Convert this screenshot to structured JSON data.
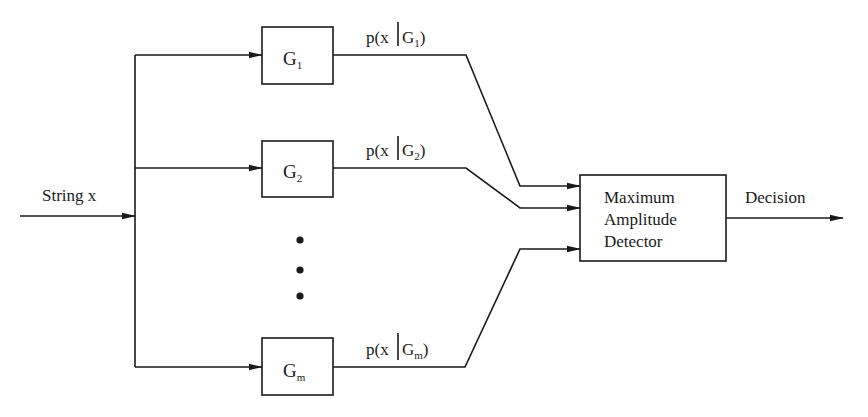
{
  "diagram": {
    "type": "block-diagram",
    "colors": {
      "line": "#1a1a1a",
      "background": "#ffffff"
    },
    "input": {
      "label": "String x"
    },
    "classifiers": [
      {
        "id": "G1",
        "base": "G",
        "subscript": "1",
        "output_label_prefix": "p(x",
        "output_label_sep": "|",
        "output_label_base": "G",
        "output_label_sub": "1",
        "output_label_suffix": ")"
      },
      {
        "id": "G2",
        "base": "G",
        "subscript": "2",
        "output_label_prefix": "p(x",
        "output_label_sep": "|",
        "output_label_base": "G",
        "output_label_sub": "2",
        "output_label_suffix": ")"
      },
      {
        "id": "Gm",
        "base": "G",
        "subscript": "m",
        "output_label_prefix": "p(x",
        "output_label_sep": "|",
        "output_label_base": "G",
        "output_label_sub": "m",
        "output_label_suffix": ")"
      }
    ],
    "ellipsis": "vertical dots",
    "detector": {
      "lines": [
        "Maximum",
        "Amplitude",
        "Detector"
      ]
    },
    "output": {
      "label": "Decision"
    }
  }
}
